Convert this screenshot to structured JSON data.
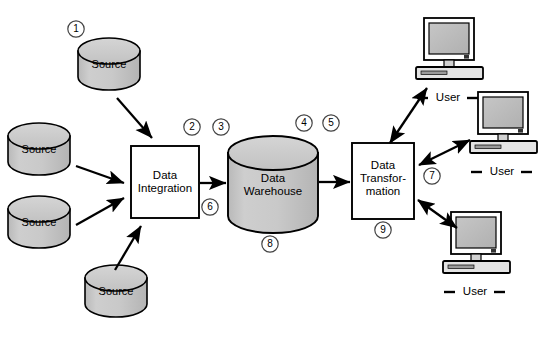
{
  "figure": {
    "caption": "",
    "background_color": "#ffffff",
    "shape_fill": "#c8c8c8",
    "stroke_color": "#000000"
  },
  "sources": [
    {
      "id": "source-1",
      "label": "Source",
      "marker": "1",
      "x": 78,
      "y": 38,
      "w": 62,
      "h": 52
    },
    {
      "id": "source-2",
      "label": "Source",
      "marker": "",
      "x": 8,
      "y": 123,
      "w": 62,
      "h": 52
    },
    {
      "id": "source-3",
      "label": "Source",
      "marker": "",
      "x": 8,
      "y": 196,
      "w": 62,
      "h": 52
    },
    {
      "id": "source-4",
      "label": "Source",
      "marker": "",
      "x": 85,
      "y": 265,
      "w": 62,
      "h": 52
    }
  ],
  "process_boxes": [
    {
      "id": "data-integration",
      "lines": [
        "Data",
        "Integration"
      ],
      "x": 131,
      "y": 146,
      "w": 68,
      "h": 72,
      "markers_top": [
        "2"
      ],
      "marker_bottom_right": "6"
    },
    {
      "id": "data-transformation",
      "lines": [
        "Data",
        "Transfor-",
        "mation"
      ],
      "x": 352,
      "y": 143,
      "w": 62,
      "h": 76,
      "marker_bottom": "9"
    }
  ],
  "warehouse": {
    "id": "data-warehouse",
    "lines": [
      "Data",
      "Warehouse"
    ],
    "marker_left": "3",
    "markers_right": [
      "4",
      "5"
    ],
    "marker_bottom": "8",
    "x": 228,
    "y": 136,
    "w": 90,
    "h": 94
  },
  "users": [
    {
      "id": "user-1",
      "label": "User",
      "x": 423,
      "y": 18,
      "marker": ""
    },
    {
      "id": "user-2",
      "label": "User",
      "x": 477,
      "y": 92,
      "marker": ""
    },
    {
      "id": "user-3",
      "label": "User",
      "x": 450,
      "y": 212,
      "marker": ""
    }
  ],
  "markers": [
    {
      "id": "marker-1",
      "label": "1",
      "x": 69,
      "y": 21
    },
    {
      "id": "marker-2",
      "label": "2",
      "x": 185,
      "y": 119
    },
    {
      "id": "marker-3",
      "label": "3",
      "x": 214,
      "y": 119
    },
    {
      "id": "marker-4",
      "label": "4",
      "x": 297,
      "y": 115
    },
    {
      "id": "marker-5",
      "label": "5",
      "x": 324,
      "y": 115
    },
    {
      "id": "marker-6",
      "label": "6",
      "x": 203,
      "y": 199
    },
    {
      "id": "marker-7",
      "label": "7",
      "x": 425,
      "y": 168
    },
    {
      "id": "marker-8",
      "label": "8",
      "x": 263,
      "y": 236
    },
    {
      "id": "marker-9",
      "label": "9",
      "x": 376,
      "y": 222
    }
  ],
  "flows": [
    {
      "id": "flow-source1-to-integration",
      "from": "source-1",
      "to": "data-integration",
      "type": "single"
    },
    {
      "id": "flow-source2-to-integration",
      "from": "source-2",
      "to": "data-integration",
      "type": "single"
    },
    {
      "id": "flow-source3-to-integration",
      "from": "source-3",
      "to": "data-integration",
      "type": "single"
    },
    {
      "id": "flow-source4-to-integration",
      "from": "source-4",
      "to": "data-integration",
      "type": "single"
    },
    {
      "id": "flow-integration-to-warehouse",
      "from": "data-integration",
      "to": "data-warehouse",
      "type": "single"
    },
    {
      "id": "flow-warehouse-to-transformation",
      "from": "data-warehouse",
      "to": "data-transformation",
      "type": "single"
    },
    {
      "id": "flow-transformation-user1",
      "from": "data-transformation",
      "to": "user-1",
      "type": "double"
    },
    {
      "id": "flow-transformation-user2",
      "from": "data-transformation",
      "to": "user-2",
      "type": "double"
    },
    {
      "id": "flow-transformation-user3",
      "from": "data-transformation",
      "to": "user-3",
      "type": "double"
    }
  ]
}
